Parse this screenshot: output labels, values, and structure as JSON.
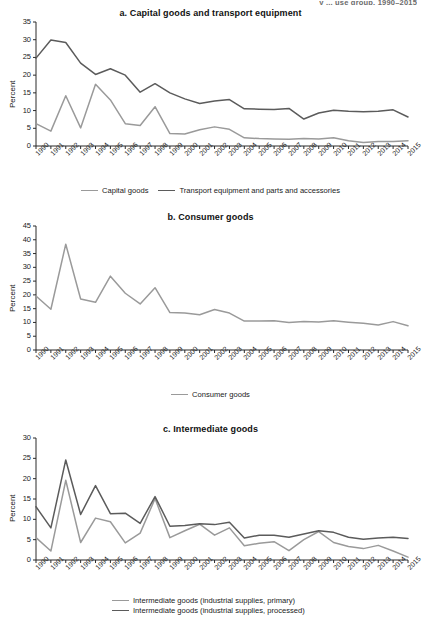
{
  "cut_header": "y ... use group, 1990–2015",
  "colors": {
    "light_gray": "#9a9a9a",
    "dark_gray": "#5b5b5b",
    "axis": "#2b2b2b",
    "text": "#1a1a1a"
  },
  "ylabel": "Percent",
  "years": [
    "1990",
    "1991",
    "1992",
    "1993",
    "1994",
    "1995",
    "1996",
    "1997",
    "1998",
    "1999",
    "2000",
    "2001",
    "2002",
    "2003",
    "2004",
    "2005",
    "2006",
    "2007",
    "2008",
    "2009",
    "2010",
    "2011",
    "2012",
    "2013",
    "2014",
    "2015"
  ],
  "panels": {
    "a": {
      "title": "a. Capital goods and transport equipment",
      "yticks": [
        "0",
        "5",
        "10",
        "15",
        "20",
        "25",
        "30",
        "35"
      ],
      "legend": [
        {
          "label": "Capital goods",
          "color": "#9a9a9a"
        },
        {
          "label": "Transport equipment and parts and accessories",
          "color": "#5b5b5b"
        }
      ]
    },
    "b": {
      "title": "b. Consumer goods",
      "yticks": [
        "0",
        "5",
        "10",
        "15",
        "20",
        "25",
        "30",
        "35",
        "40",
        "45"
      ],
      "legend": [
        {
          "label": "Consumer goods",
          "color": "#9a9a9a"
        }
      ]
    },
    "c": {
      "title": "c. Intermediate goods",
      "yticks": [
        "0",
        "5",
        "10",
        "15",
        "20",
        "25",
        "30"
      ],
      "legend": [
        {
          "label": "Intermediate goods (industrial supplies, primary)",
          "color": "#9a9a9a"
        },
        {
          "label": "Intermediate goods (industrial supplies, processed)",
          "color": "#5b5b5b"
        }
      ]
    }
  },
  "chart_data": [
    {
      "id": "a",
      "type": "line",
      "title": "a. Capital goods and transport equipment",
      "xlabel": "",
      "ylabel": "Percent",
      "ylim": [
        0,
        35
      ],
      "ytick_step": 5,
      "grid": false,
      "legend_position": "bottom",
      "x": [
        "1990",
        "1991",
        "1992",
        "1993",
        "1994",
        "1995",
        "1996",
        "1997",
        "1998",
        "1999",
        "2000",
        "2001",
        "2002",
        "2003",
        "2004",
        "2005",
        "2006",
        "2007",
        "2008",
        "2009",
        "2010",
        "2011",
        "2012",
        "2013",
        "2014",
        "2015"
      ],
      "series": [
        {
          "name": "Capital goods",
          "color": "#9a9a9a",
          "values": [
            6.3,
            4.2,
            14.2,
            5.1,
            17.4,
            13.0,
            6.3,
            5.8,
            11.1,
            3.5,
            3.4,
            4.6,
            5.4,
            4.7,
            2.3,
            2.1,
            2.0,
            1.9,
            2.1,
            2.0,
            2.3,
            1.5,
            1.0,
            1.3,
            1.3,
            1.5
          ]
        },
        {
          "name": "Transport equipment and parts and accessories",
          "color": "#5b5b5b",
          "values": [
            24.8,
            29.9,
            29.2,
            23.4,
            20.2,
            21.8,
            20.0,
            15.2,
            17.6,
            15.0,
            13.3,
            12.0,
            12.7,
            13.1,
            10.5,
            10.4,
            10.3,
            10.6,
            7.6,
            9.3,
            10.1,
            9.8,
            9.7,
            9.8,
            10.2,
            8.2
          ]
        }
      ]
    },
    {
      "id": "b",
      "type": "line",
      "title": "b. Consumer goods",
      "xlabel": "",
      "ylabel": "Percent",
      "ylim": [
        0,
        45
      ],
      "ytick_step": 5,
      "grid": false,
      "legend_position": "bottom",
      "x": [
        "1990",
        "1991",
        "1992",
        "1993",
        "1994",
        "1995",
        "1996",
        "1997",
        "1998",
        "1999",
        "2000",
        "2001",
        "2002",
        "2003",
        "2004",
        "2005",
        "2006",
        "2007",
        "2008",
        "2009",
        "2010",
        "2011",
        "2012",
        "2013",
        "2014",
        "2015"
      ],
      "series": [
        {
          "name": "Consumer goods",
          "color": "#9a9a9a",
          "values": [
            19.6,
            14.8,
            38.4,
            18.5,
            17.3,
            26.8,
            20.6,
            16.7,
            22.6,
            13.6,
            13.4,
            12.8,
            14.7,
            13.4,
            10.5,
            10.5,
            10.6,
            10.0,
            10.3,
            10.2,
            10.6,
            10.1,
            9.7,
            9.1,
            10.3,
            8.8
          ]
        }
      ]
    },
    {
      "id": "c",
      "type": "line",
      "title": "c. Intermediate goods",
      "xlabel": "",
      "ylabel": "Percent",
      "ylim": [
        0,
        30
      ],
      "ytick_step": 5,
      "grid": false,
      "legend_position": "bottom",
      "x": [
        "1990",
        "1991",
        "1992",
        "1993",
        "1994",
        "1995",
        "1996",
        "1997",
        "1998",
        "1999",
        "2000",
        "2001",
        "2002",
        "2003",
        "2004",
        "2005",
        "2006",
        "2007",
        "2008",
        "2009",
        "2010",
        "2011",
        "2012",
        "2013",
        "2014",
        "2015"
      ],
      "series": [
        {
          "name": "Intermediate goods (industrial supplies, primary)",
          "color": "#9a9a9a",
          "values": [
            5.5,
            2.2,
            19.6,
            4.3,
            10.3,
            9.4,
            4.2,
            6.6,
            15.1,
            5.5,
            7.2,
            8.8,
            6.1,
            7.9,
            3.5,
            4.1,
            4.5,
            2.3,
            5.0,
            7.0,
            4.3,
            3.3,
            2.8,
            3.6,
            2.2,
            0.7
          ]
        },
        {
          "name": "Intermediate goods (industrial supplies, processed)",
          "color": "#5b5b5b",
          "values": [
            13.1,
            7.9,
            24.6,
            11.2,
            18.3,
            11.4,
            11.5,
            9.0,
            15.6,
            8.3,
            8.5,
            8.9,
            8.7,
            9.3,
            5.4,
            6.1,
            6.1,
            5.6,
            6.4,
            7.2,
            6.8,
            5.6,
            5.1,
            5.4,
            5.6,
            5.3
          ]
        }
      ]
    }
  ]
}
